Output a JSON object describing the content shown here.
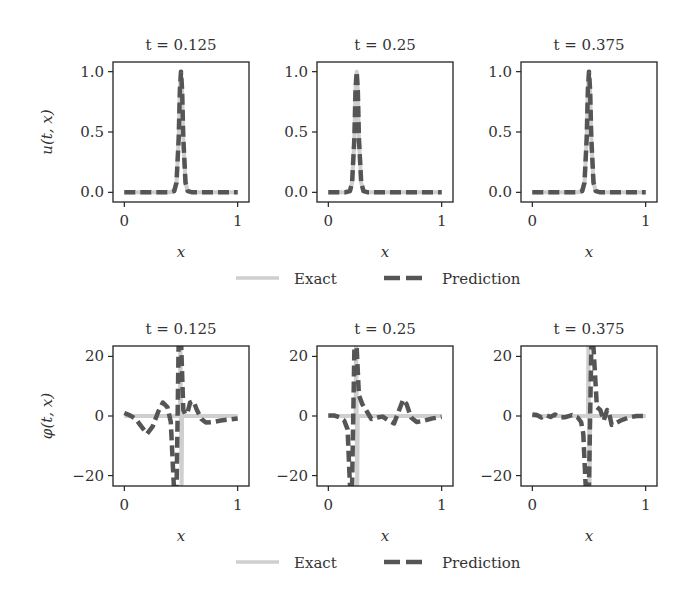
{
  "colors": {
    "exact": "#cfcfcf",
    "prediction": "#555555",
    "frame": "#222222",
    "text": "#333333"
  },
  "legend": {
    "exact_label": "Exact",
    "prediction_label": "Prediction"
  },
  "chart_data": [
    {
      "type": "line",
      "row": 0,
      "col": 0,
      "title": "t = 0.125",
      "xlabel": "x",
      "ylabel": "u(t, x)",
      "xlim": [
        -0.1,
        1.1
      ],
      "ylim": [
        -0.08,
        1.08
      ],
      "xticks": [
        0,
        1
      ],
      "xtick_labels": [
        "0",
        "1"
      ],
      "yticks": [
        0,
        0.5,
        1.0
      ],
      "ytick_labels": [
        "0.0",
        "0.5",
        "1.0"
      ],
      "grid": false,
      "legend_position": "below",
      "series": [
        {
          "name": "Exact",
          "style": "solid",
          "x": [
            0,
            0.4,
            0.44,
            0.46,
            0.48,
            0.49,
            0.5,
            0.51,
            0.52,
            0.54,
            0.56,
            0.6,
            1.0
          ],
          "y": [
            0,
            0,
            0.01,
            0.08,
            0.45,
            0.85,
            1.0,
            0.85,
            0.45,
            0.08,
            0.01,
            0,
            0
          ]
        },
        {
          "name": "Prediction",
          "style": "dashed",
          "x": [
            0,
            0.4,
            0.44,
            0.46,
            0.48,
            0.49,
            0.5,
            0.51,
            0.52,
            0.54,
            0.56,
            0.6,
            1.0
          ],
          "y": [
            0,
            0,
            0.01,
            0.08,
            0.45,
            0.85,
            1.0,
            0.85,
            0.45,
            0.08,
            0.01,
            0,
            0
          ]
        }
      ]
    },
    {
      "type": "line",
      "row": 0,
      "col": 1,
      "title": "t = 0.25",
      "xlabel": "x",
      "ylabel": "",
      "xlim": [
        -0.1,
        1.1
      ],
      "ylim": [
        -0.08,
        1.08
      ],
      "xticks": [
        0,
        1
      ],
      "xtick_labels": [
        "0",
        "1"
      ],
      "yticks": [
        0,
        0.5,
        1.0
      ],
      "ytick_labels": [
        "0.0",
        "0.5",
        "1.0"
      ],
      "grid": false,
      "series": [
        {
          "name": "Exact",
          "style": "solid",
          "x": [
            0,
            0.15,
            0.19,
            0.21,
            0.23,
            0.24,
            0.25,
            0.26,
            0.27,
            0.29,
            0.31,
            0.35,
            1.0
          ],
          "y": [
            0,
            0,
            0.01,
            0.08,
            0.45,
            0.85,
            1.0,
            0.85,
            0.45,
            0.08,
            0.01,
            0,
            0
          ]
        },
        {
          "name": "Prediction",
          "style": "dashed",
          "x": [
            0,
            0.15,
            0.19,
            0.21,
            0.23,
            0.24,
            0.25,
            0.26,
            0.27,
            0.29,
            0.31,
            0.35,
            1.0
          ],
          "y": [
            0,
            0,
            0.01,
            0.08,
            0.45,
            0.85,
            1.0,
            0.85,
            0.45,
            0.08,
            0.01,
            0,
            0
          ]
        }
      ]
    },
    {
      "type": "line",
      "row": 0,
      "col": 2,
      "title": "t = 0.375",
      "xlabel": "x",
      "ylabel": "",
      "xlim": [
        -0.1,
        1.1
      ],
      "ylim": [
        -0.08,
        1.08
      ],
      "xticks": [
        0,
        1
      ],
      "xtick_labels": [
        "0",
        "1"
      ],
      "yticks": [
        0,
        0.5,
        1.0
      ],
      "ytick_labels": [
        "0.0",
        "0.5",
        "1.0"
      ],
      "grid": false,
      "series": [
        {
          "name": "Exact",
          "style": "solid",
          "x": [
            0,
            0.4,
            0.44,
            0.46,
            0.48,
            0.49,
            0.5,
            0.51,
            0.52,
            0.54,
            0.56,
            0.6,
            1.0
          ],
          "y": [
            0,
            0,
            0.01,
            0.08,
            0.45,
            0.85,
            1.0,
            0.85,
            0.45,
            0.08,
            0.01,
            0,
            0
          ]
        },
        {
          "name": "Prediction",
          "style": "dashed",
          "x": [
            0,
            0.4,
            0.44,
            0.46,
            0.48,
            0.49,
            0.5,
            0.51,
            0.52,
            0.54,
            0.56,
            0.6,
            1.0
          ],
          "y": [
            0,
            0,
            0.01,
            0.08,
            0.45,
            0.85,
            1.0,
            0.85,
            0.45,
            0.08,
            0.01,
            0,
            0
          ]
        }
      ]
    },
    {
      "type": "line",
      "row": 1,
      "col": 0,
      "title": "t = 0.125",
      "xlabel": "x",
      "ylabel": "φ(t, x)",
      "xlim": [
        -0.1,
        1.1
      ],
      "ylim": [
        -23.5,
        23.5
      ],
      "xticks": [
        0,
        1
      ],
      "xtick_labels": [
        "0",
        "1"
      ],
      "yticks": [
        -20,
        0,
        20
      ],
      "ytick_labels": [
        "−20",
        "0",
        "20"
      ],
      "grid": false,
      "legend_position": "below",
      "series": [
        {
          "name": "Exact",
          "style": "solid",
          "x": [
            0,
            0.49,
            0.495,
            0.5,
            0.505,
            0.51,
            1.0
          ],
          "y": [
            0,
            0,
            25,
            0,
            -25,
            0,
            0
          ]
        },
        {
          "name": "Prediction",
          "style": "dashed",
          "x": [
            0,
            0.05,
            0.1,
            0.15,
            0.2,
            0.25,
            0.3,
            0.34,
            0.38,
            0.41,
            0.44,
            0.46,
            0.48,
            0.5,
            0.52,
            0.54,
            0.56,
            0.58,
            0.61,
            0.64,
            0.68,
            0.72,
            0.78,
            0.85,
            0.92,
            1.0
          ],
          "y": [
            1.0,
            0.2,
            -1.0,
            -3.5,
            -6.0,
            -3.5,
            1.5,
            4.5,
            3.0,
            -2.0,
            -26,
            -26,
            26,
            26,
            2,
            0.5,
            1.5,
            4.5,
            5.0,
            2.0,
            -1.0,
            -2.2,
            -2.0,
            -1.5,
            -1.2,
            -0.8
          ]
        }
      ]
    },
    {
      "type": "line",
      "row": 1,
      "col": 1,
      "title": "t = 0.25",
      "xlabel": "x",
      "ylabel": "",
      "xlim": [
        -0.1,
        1.1
      ],
      "ylim": [
        -23.5,
        23.5
      ],
      "xticks": [
        0,
        1
      ],
      "xtick_labels": [
        "0",
        "1"
      ],
      "yticks": [
        -20,
        0,
        20
      ],
      "ytick_labels": [
        "−20",
        "0",
        "20"
      ],
      "grid": false,
      "series": [
        {
          "name": "Exact",
          "style": "solid",
          "x": [
            0,
            0.24,
            0.245,
            0.25,
            0.255,
            0.26,
            1.0
          ],
          "y": [
            0,
            0,
            25,
            0,
            -25,
            0,
            0
          ]
        },
        {
          "name": "Prediction",
          "style": "dashed",
          "x": [
            0,
            0.05,
            0.1,
            0.14,
            0.17,
            0.19,
            0.21,
            0.23,
            0.25,
            0.27,
            0.3,
            0.34,
            0.38,
            0.43,
            0.48,
            0.53,
            0.58,
            0.62,
            0.66,
            0.69,
            0.73,
            0.78,
            0.85,
            0.92,
            1.0
          ],
          "y": [
            0.2,
            0.2,
            -0.5,
            -1.5,
            -4.5,
            -23,
            -23,
            23,
            23,
            7.0,
            4.0,
            1.5,
            -1.0,
            -0.5,
            -0.2,
            -1.5,
            -2.5,
            1.5,
            5.5,
            4.0,
            -0.5,
            -2.0,
            -1.5,
            -0.8,
            -0.3
          ]
        }
      ]
    },
    {
      "type": "line",
      "row": 1,
      "col": 2,
      "title": "t = 0.375",
      "xlabel": "x",
      "ylabel": "",
      "xlim": [
        -0.1,
        1.1
      ],
      "ylim": [
        -23.5,
        23.5
      ],
      "xticks": [
        0,
        1
      ],
      "xtick_labels": [
        "0",
        "1"
      ],
      "yticks": [
        -20,
        0,
        20
      ],
      "ytick_labels": [
        "−20",
        "0",
        "20"
      ],
      "grid": false,
      "series": [
        {
          "name": "Exact",
          "style": "solid",
          "x": [
            0,
            0.49,
            0.495,
            0.5,
            0.505,
            0.51,
            1.0
          ],
          "y": [
            0,
            0,
            25,
            0,
            -25,
            0,
            0
          ]
        },
        {
          "name": "Prediction",
          "style": "dashed",
          "x": [
            0,
            0.04,
            0.08,
            0.12,
            0.16,
            0.2,
            0.25,
            0.3,
            0.35,
            0.4,
            0.43,
            0.45,
            0.47,
            0.5,
            0.52,
            0.54,
            0.57,
            0.6,
            0.63,
            0.66,
            0.68,
            0.7,
            0.73,
            0.78,
            0.85,
            0.92,
            1.0
          ],
          "y": [
            0.5,
            0.3,
            -0.5,
            0.3,
            -0.3,
            0.5,
            -0.5,
            -0.3,
            0.3,
            -0.5,
            -2.0,
            -6.0,
            -23,
            -23,
            23,
            23,
            3.0,
            2.0,
            -1.5,
            2.0,
            0.5,
            -3.0,
            -2.5,
            -1.5,
            -0.5,
            0.0,
            0.0
          ]
        }
      ]
    }
  ]
}
